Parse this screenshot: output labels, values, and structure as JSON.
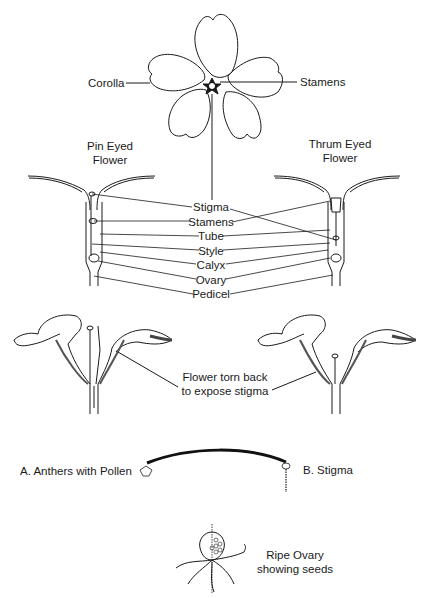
{
  "diagram": {
    "top_flower": {
      "labels": {
        "corolla": "Corolla",
        "stamens": "Stamens"
      }
    },
    "pin_eyed": {
      "line1": "Pin Eyed",
      "line2": "Flower"
    },
    "thrum_eyed": {
      "line1": "Thrum Eyed",
      "line2": "Flower"
    },
    "parts": [
      "Stigma",
      "Stamens",
      "Tube",
      "Style",
      "Calyx",
      "Ovary",
      "Pedicel"
    ],
    "torn_flower": {
      "line1": "Flower torn back",
      "line2": "to expose stigma"
    },
    "pollination": {
      "anthers": "A. Anthers with Pollen",
      "stigma": "B. Stigma"
    },
    "ripe_ovary": {
      "line1": "Ripe Ovary",
      "line2": "showing seeds"
    }
  },
  "colors": {
    "ink": "#1a1a1a",
    "background": "#ffffff"
  }
}
